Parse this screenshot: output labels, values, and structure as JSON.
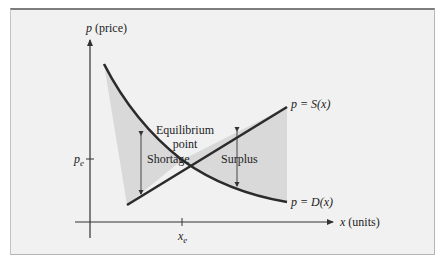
{
  "diagram": {
    "y_axis_label": {
      "var": "p",
      "unit": " (price)"
    },
    "x_axis_label": {
      "var": "x",
      "unit": " (units)"
    },
    "supply_label": {
      "prefix": "p = ",
      "fn": "S",
      "arg": "(x)"
    },
    "demand_label": {
      "prefix": "p = ",
      "fn": "D",
      "arg": "(x)"
    },
    "equilibrium_label": [
      "Equilibrium",
      "point"
    ],
    "shortage_label": "Shortage",
    "surplus_label": "Surplus",
    "pe_label": {
      "base": "p",
      "sub": "e"
    },
    "xe_label": {
      "base": "x",
      "sub": "e"
    },
    "colors": {
      "curve": "#2b2b2b",
      "shade": "#d9d9d9",
      "background": "#f1f1f1",
      "axis": "#333333"
    }
  }
}
